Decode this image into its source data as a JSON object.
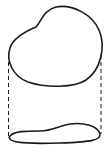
{
  "diagram": {
    "type": "projection-drawing",
    "colors": {
      "background": "#ffffff",
      "stroke": "#1a1a1a"
    },
    "shapes": [
      {
        "id": "top-blob",
        "style": "solid"
      },
      {
        "id": "left-projection-line",
        "style": "dashed"
      },
      {
        "id": "right-projection-line",
        "style": "dashed"
      },
      {
        "id": "bottom-flattened-shape",
        "style": "solid"
      }
    ],
    "labels": []
  }
}
